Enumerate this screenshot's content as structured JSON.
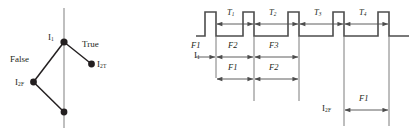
{
  "figure": {
    "left_diagram": {
      "name": "decision-tree",
      "root_node": {
        "label": "I",
        "sub": "1"
      },
      "branches": [
        {
          "label": "False",
          "target": {
            "label": "I",
            "sub": "2F"
          }
        },
        {
          "label": "True",
          "target": {
            "label": "I",
            "sub": "2T"
          }
        }
      ],
      "nodes": [
        {
          "id": "root",
          "label": "I",
          "sub": "1",
          "x": 64,
          "y": 42
        },
        {
          "id": "true",
          "label": "I",
          "sub": "2T",
          "x": 91,
          "y": 64
        },
        {
          "id": "false",
          "label": "I",
          "sub": "2F",
          "x": 33,
          "y": 82
        },
        {
          "id": "leaf",
          "label": "",
          "sub": "",
          "x": 64,
          "y": 112
        }
      ],
      "axis_line": {
        "x": 64,
        "y1": 8,
        "y2": 128,
        "color": "#8a8a8a"
      },
      "edge_color": "#231f20",
      "node_color": "#231f20"
    },
    "right_diagram": {
      "name": "timing-diagram",
      "waveform": {
        "baseline_y": 36,
        "high_y": 12,
        "pulse_count": 5,
        "color": "#4d4d4d"
      },
      "row_top": {
        "name": "T-intervals",
        "intervals": [
          {
            "label": "T",
            "sub": "1"
          },
          {
            "label": "T",
            "sub": "2"
          },
          {
            "label": "T",
            "sub": "3"
          },
          {
            "label": "T",
            "sub": "4"
          }
        ]
      },
      "row_i1": {
        "signal": {
          "label": "I",
          "sub": "1"
        },
        "intervals": [
          {
            "label": "F1"
          },
          {
            "label": "F2"
          },
          {
            "label": "F3"
          }
        ]
      },
      "row_mid": {
        "intervals": [
          {
            "label": "F1"
          },
          {
            "label": "F2"
          }
        ]
      },
      "row_i2f": {
        "signal": {
          "label": "I",
          "sub": "2F"
        },
        "intervals": [
          {
            "label": "F1"
          }
        ]
      }
    }
  }
}
